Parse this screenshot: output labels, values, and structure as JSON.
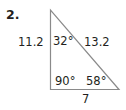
{
  "problem": {
    "number": "2."
  },
  "triangle": {
    "sides": {
      "left": "11.2",
      "hypotenuse": "13.2",
      "bottom": "7"
    },
    "angles": {
      "top": "32°",
      "right_angle": "90°",
      "bottom_right": "58°"
    },
    "stroke_color": "#8a8a8a",
    "text_color": "#231f20"
  }
}
